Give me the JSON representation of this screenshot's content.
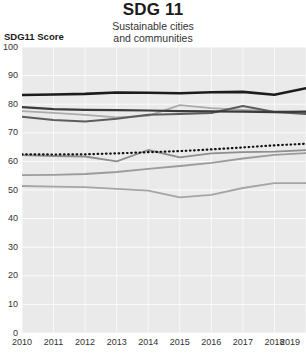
{
  "header": {
    "title": "SDG 11",
    "subtitle_line1": "Sustainable cities",
    "subtitle_line2": "and communities"
  },
  "axis": {
    "y_label": "SDG11 Score"
  },
  "chart_data": {
    "type": "line",
    "title": "SDG 11",
    "subtitle": "Sustainable cities and communities",
    "xlabel": "",
    "ylabel": "SDG11 Score",
    "ylim": [
      0,
      100
    ],
    "y_ticks": [
      100,
      90,
      80,
      70,
      60,
      50,
      40,
      30,
      20,
      10,
      0
    ],
    "x": [
      2010,
      2011,
      2012,
      2013,
      2014,
      2015,
      2016,
      2017,
      2018,
      2019
    ],
    "grid": true,
    "legend": "none",
    "plot_bg": "#eaeaea",
    "grid_color": "#ffffff",
    "series": [
      {
        "name": "line-4-light-gray",
        "style": "solid",
        "color": "#ababab",
        "width": 1.8,
        "values": [
          77.6,
          77.0,
          76.3,
          75.4,
          75.9,
          79.7,
          78.6,
          78.0,
          77.6,
          77.2
        ]
      },
      {
        "name": "line-7-gray-rising",
        "style": "solid",
        "color": "#9c9c9c",
        "width": 1.8,
        "values": [
          55.2,
          55.3,
          55.6,
          56.3,
          57.4,
          58.4,
          59.5,
          61.0,
          62.3,
          62.9
        ]
      },
      {
        "name": "line-8-gray-bottom",
        "style": "solid",
        "color": "#a5a5a5",
        "width": 1.8,
        "values": [
          51.4,
          51.2,
          51.0,
          50.4,
          49.8,
          47.4,
          48.3,
          50.7,
          52.4,
          52.4
        ]
      },
      {
        "name": "line-6-gray-mid",
        "style": "solid",
        "color": "#8e8e8e",
        "width": 1.8,
        "values": [
          62.2,
          61.9,
          61.7,
          60.0,
          64.0,
          61.4,
          62.8,
          63.2,
          63.4,
          63.9
        ]
      },
      {
        "name": "line-3-medium-gray",
        "style": "solid",
        "color": "#5d5d5d",
        "width": 2.0,
        "values": [
          75.6,
          74.5,
          73.9,
          74.9,
          76.3,
          76.6,
          76.9,
          79.4,
          77.3,
          76.6
        ]
      },
      {
        "name": "line-2-dark-gray",
        "style": "solid",
        "color": "#3a3a3a",
        "width": 2.2,
        "values": [
          79.0,
          78.3,
          78.0,
          77.9,
          77.8,
          77.6,
          77.5,
          77.4,
          77.2,
          77.4
        ]
      },
      {
        "name": "line-1-black-thick",
        "style": "solid",
        "color": "#1c1c1c",
        "width": 2.6,
        "values": [
          83.2,
          83.4,
          83.6,
          84.1,
          84.0,
          83.8,
          84.2,
          84.3,
          83.3,
          85.6
        ]
      },
      {
        "name": "line-5-dotted-black",
        "style": "dotted",
        "color": "#111111",
        "width": 2.2,
        "values": [
          62.5,
          62.4,
          62.5,
          62.8,
          63.2,
          63.6,
          64.2,
          64.9,
          65.6,
          66.2
        ]
      }
    ]
  }
}
